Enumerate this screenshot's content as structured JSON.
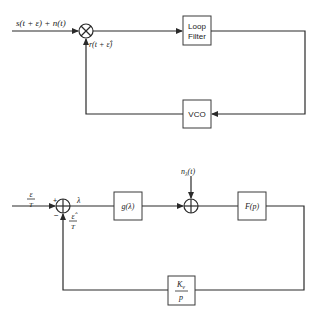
{
  "diagram_top": {
    "input_label": "s(t + ε) + n(t)",
    "feedback_label": "r(t + ε̂)",
    "loop_filter_line1": "Loop",
    "loop_filter_line2": "Filter",
    "vco_label": "VCO"
  },
  "diagram_bottom": {
    "input_label_num": "ε",
    "input_label_den": "T",
    "plus_sign": "+",
    "minus_sign": "−",
    "feedback_label_num": "ε̂",
    "feedback_label_den": "T",
    "error_label": "λ",
    "nonlinearity_label": "g(λ)",
    "noise_label": "n",
    "noise_sub": "λ",
    "noise_arg": "(t)",
    "filter_label": "F(p)",
    "vco_num": "K",
    "vco_sub": "v",
    "vco_den": "p"
  },
  "colors": {
    "line": "#2a2a2a",
    "background": "#ffffff"
  }
}
